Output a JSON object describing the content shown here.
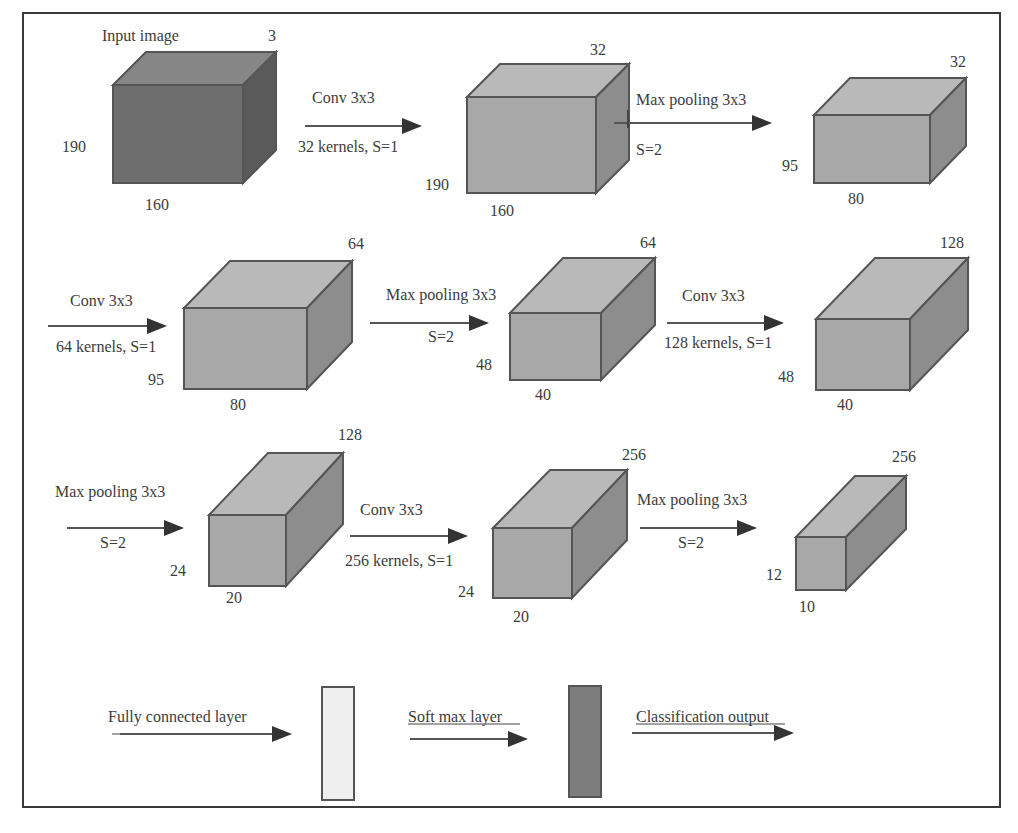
{
  "figure": {
    "type": "cnn-architecture-diagram",
    "colors": {
      "input_front": "#6e6e6e",
      "input_top": "#868686",
      "input_side": "#5a5a5a",
      "front": "#a8a8a8",
      "top": "#b9b9b9",
      "side": "#8d8d8d",
      "edge": "#555555",
      "arrow": "#333333",
      "text": "#3c3c3c",
      "fc_fill": "#efefef",
      "softmax_fill": "#7d7d7d"
    },
    "blocks": [
      {
        "id": "input",
        "title": "Input image",
        "depth": "3",
        "height": "190",
        "width": "160"
      },
      {
        "id": "conv1",
        "depth": "32",
        "height": "190",
        "width": "160"
      },
      {
        "id": "pool1",
        "depth": "32",
        "height": "95",
        "width": "80"
      },
      {
        "id": "conv2",
        "depth": "64",
        "height": "95",
        "width": "80"
      },
      {
        "id": "pool2",
        "depth": "64",
        "height": "48",
        "width": "40"
      },
      {
        "id": "conv3",
        "depth": "128",
        "height": "48",
        "width": "40"
      },
      {
        "id": "pool3",
        "depth": "128",
        "height": "24",
        "width": "20"
      },
      {
        "id": "conv4",
        "depth": "256",
        "height": "24",
        "width": "20"
      },
      {
        "id": "pool4",
        "depth": "256",
        "height": "12",
        "width": "10"
      }
    ],
    "operations": [
      {
        "top": "Conv 3x3",
        "bottom": "32 kernels, S=1"
      },
      {
        "top": "Max pooling 3x3",
        "bottom": "S=2"
      },
      {
        "top": "Conv 3x3",
        "bottom": "64 kernels, S=1"
      },
      {
        "top": "Max pooling 3x3",
        "bottom": "S=2"
      },
      {
        "top": "Conv 3x3",
        "bottom": "128 kernels, S=1"
      },
      {
        "top": "Max pooling 3x3",
        "bottom": "S=2"
      },
      {
        "top": "Conv 3x3",
        "bottom": "256 kernels, S=1"
      },
      {
        "top": "Max pooling 3x3",
        "bottom": "S=2"
      }
    ],
    "final_stage": {
      "fully_connected": "Fully connected layer",
      "softmax": "Soft max layer",
      "output": "Classification output"
    }
  }
}
